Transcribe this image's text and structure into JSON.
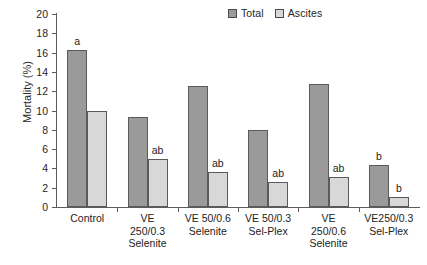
{
  "chart_data": {
    "type": "bar",
    "title": "",
    "xlabel": "",
    "ylabel": "Mortality (%)",
    "ylim": [
      0,
      20
    ],
    "ytick_step": 2,
    "yticks": [
      "20",
      "18",
      "16",
      "14",
      "12",
      "10",
      "8",
      "6",
      "4",
      "2",
      "0"
    ],
    "grid": false,
    "legend_position": "top-center-right",
    "categories": [
      "Control",
      "VE 250/0.3 Selenite",
      "VE 50/0.6 Selenite",
      "VE 50/0.3 Sel-Plex",
      "VE 250/0.6 Selenite",
      "VE250/0.3 Sel-Plex"
    ],
    "category_label_lines": [
      [
        "Control"
      ],
      [
        "VE",
        "250/0.3",
        "Selenite"
      ],
      [
        "VE 50/0.6",
        "Selenite"
      ],
      [
        "VE 50/0.3",
        "Sel-Plex"
      ],
      [
        "VE",
        "250/0.6",
        "Selenite"
      ],
      [
        "VE250/0.3",
        "Sel-Plex"
      ]
    ],
    "series": [
      {
        "name": "Total",
        "color": "#9a9a9a",
        "values": [
          16.3,
          9.3,
          12.5,
          8.0,
          12.7,
          4.4
        ],
        "annotations": [
          "a",
          "",
          "",
          "",
          "",
          "b"
        ]
      },
      {
        "name": "Ascites",
        "color": "#d8d8d8",
        "values": [
          10.0,
          5.0,
          3.6,
          2.6,
          3.1,
          1.0
        ],
        "annotations": [
          "",
          "ab",
          "ab",
          "ab",
          "ab",
          "b"
        ]
      }
    ]
  },
  "legend": {
    "entries": [
      {
        "label": "Total",
        "color": "#9a9a9a"
      },
      {
        "label": "Ascites",
        "color": "#d8d8d8"
      }
    ]
  },
  "axis": {
    "y_title": "Mortality (%)"
  }
}
